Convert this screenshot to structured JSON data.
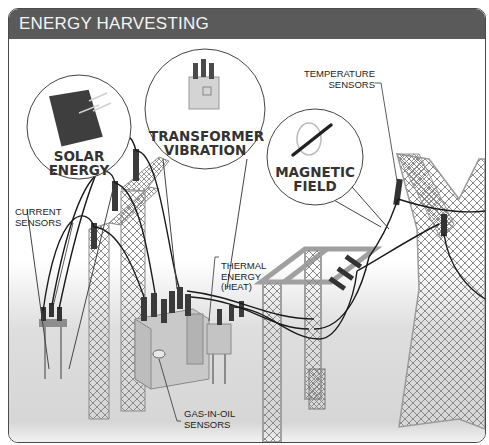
{
  "header": {
    "title": "ENERGY HARVESTING"
  },
  "callouts": {
    "solar": {
      "line1": "SOLAR",
      "line2": "ENERGY",
      "icon": "solar-panel-icon"
    },
    "transformer": {
      "line1": "TRANSFORMER",
      "line2": "VIBRATION",
      "icon": "transformer-icon"
    },
    "magnetic": {
      "line1": "MAGNETIC",
      "line2": "FIELD",
      "icon": "magnetic-field-icon"
    }
  },
  "labels": {
    "current_sensors": {
      "line1": "CURRENT",
      "line2": "SENSORS"
    },
    "temperature_sensors": {
      "line1": "TEMPERATURE",
      "line2": "SENSORS"
    },
    "thermal_energy": {
      "line1": "THERMAL",
      "line2": "ENERGY",
      "line3": "(HEAT)"
    },
    "gas_in_oil": {
      "line1": "GAS-IN-OIL",
      "line2": "SENSORS"
    }
  },
  "colors": {
    "title_bar": "#5a5a5a",
    "title_text": "#f4f4f4",
    "tower": "#9a9a9a",
    "cable": "#1a1a1a",
    "ground": "#dcdcdc"
  }
}
